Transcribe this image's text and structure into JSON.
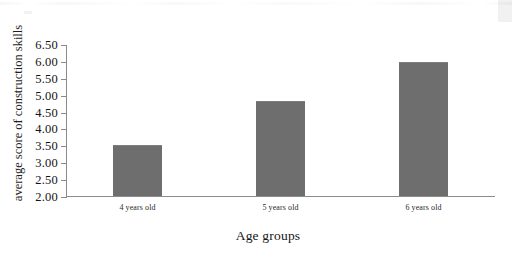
{
  "chart_data": {
    "type": "bar",
    "title": "",
    "xlabel": "Age groups",
    "ylabel": "average score of construction skills",
    "categories": [
      "4 years old",
      "5 years old",
      "6 years old"
    ],
    "values": [
      3.48,
      4.78,
      5.94
    ],
    "ylim": [
      2.0,
      6.5
    ],
    "yticks": [
      "2.00",
      "2.50",
      "3.00",
      "3.50",
      "4.00",
      "4.50",
      "5.00",
      "5.50",
      "6.00",
      "6.50"
    ],
    "ytick_values": [
      2.0,
      2.5,
      3.0,
      3.5,
      4.0,
      4.5,
      5.0,
      5.5,
      6.0,
      6.5
    ],
    "grid": false,
    "legend": null,
    "bar_color": "#6e6e6e",
    "axis_color": "#8b8b8b"
  },
  "figure": {
    "background": "#ffffff",
    "y_axis_title": "average score of construction skills",
    "x_axis_title": "Age groups"
  }
}
